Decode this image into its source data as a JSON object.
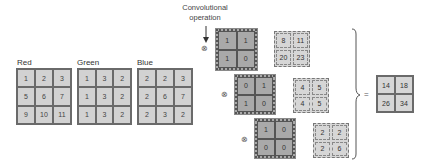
{
  "caption": {
    "line1": "Convolutional",
    "line2": "operation"
  },
  "inputs": [
    {
      "label": "Red",
      "cells": [
        "1",
        "2",
        "3",
        "5",
        "6",
        "7",
        "9",
        "10",
        "11"
      ]
    },
    {
      "label": "Green",
      "cells": [
        "1",
        "3",
        "2",
        "1",
        "3",
        "2",
        "1",
        "3",
        "2"
      ]
    },
    {
      "label": "Blue",
      "cells": [
        "2",
        "2",
        "3",
        "2",
        "6",
        "7",
        "2",
        "3",
        "2"
      ]
    }
  ],
  "operator_symbol": "⊗",
  "equals_symbol": "=",
  "kernels": [
    {
      "cells": [
        "1",
        "1",
        "1",
        "0"
      ]
    },
    {
      "cells": [
        "0",
        "1",
        "1",
        "0"
      ]
    },
    {
      "cells": [
        "1",
        "0",
        "0",
        "0"
      ]
    }
  ],
  "results": [
    {
      "cells": [
        "8",
        "11",
        "20",
        "23"
      ]
    },
    {
      "cells": [
        "4",
        "5",
        "4",
        "5"
      ]
    },
    {
      "cells": [
        "2",
        "2",
        "2",
        "6"
      ]
    }
  ],
  "final": {
    "cells": [
      "14",
      "18",
      "26",
      "34"
    ]
  }
}
